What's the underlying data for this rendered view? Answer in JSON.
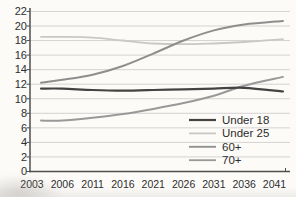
{
  "chart_data": {
    "type": "line",
    "title": "",
    "xlabel": "",
    "ylabel": "",
    "categories": [
      "2003",
      "2006",
      "2011",
      "2016",
      "2021",
      "2026",
      "2031",
      "2036",
      "2041"
    ],
    "ylim": [
      0,
      22
    ],
    "y_tick_step": 2,
    "grid": "horizontal",
    "legend_position": "inside bottom-right, no border",
    "series": [
      {
        "name": "Under 18",
        "color": "#434343",
        "width": 2.2,
        "values": [
          11.4,
          11.4,
          11.2,
          11.1,
          11.2,
          11.3,
          11.4,
          11.5,
          11.0
        ]
      },
      {
        "name": "Under 25",
        "color": "#c9c8c5",
        "width": 1.8,
        "values": [
          18.5,
          18.5,
          18.4,
          18.0,
          17.6,
          17.5,
          17.6,
          17.8,
          18.2
        ]
      },
      {
        "name": "60+",
        "color": "#8e8e8e",
        "width": 2.0,
        "values": [
          12.2,
          12.6,
          13.3,
          14.5,
          16.2,
          18.0,
          19.4,
          20.2,
          20.7
        ]
      },
      {
        "name": "70+",
        "color": "#999999",
        "width": 2.0,
        "values": [
          7.0,
          7.0,
          7.4,
          7.9,
          8.6,
          9.4,
          10.4,
          11.8,
          13.0
        ]
      }
    ],
    "colors": {
      "background": "#fcfbf8",
      "gridline": "#d4d3d0",
      "axis": "#4f4f4f",
      "tick_text": "#2d2d2d"
    }
  }
}
